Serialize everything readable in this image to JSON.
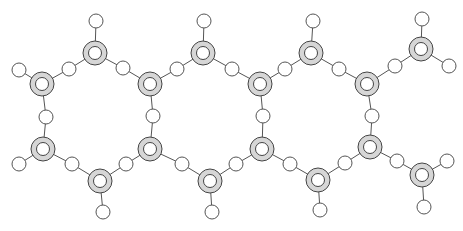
{
  "diagram": {
    "title": "",
    "colors": {
      "background": "#ffffff",
      "large_atom_fill": "#d6d6d6",
      "large_atom_stroke": "#444444",
      "small_atom_fill": "#ffffff",
      "bond": "#555555"
    },
    "large_atoms": [
      {
        "id": "T1",
        "x": 95,
        "y": 53
      },
      {
        "id": "T2",
        "x": 203,
        "y": 53
      },
      {
        "id": "T3",
        "x": 311,
        "y": 53
      },
      {
        "id": "T4",
        "x": 421,
        "y": 49
      },
      {
        "id": "U1",
        "x": 42,
        "y": 84
      },
      {
        "id": "U2",
        "x": 150,
        "y": 84
      },
      {
        "id": "U3",
        "x": 260,
        "y": 84
      },
      {
        "id": "U4",
        "x": 367,
        "y": 84
      },
      {
        "id": "L1",
        "x": 43,
        "y": 149
      },
      {
        "id": "L2",
        "x": 150,
        "y": 149
      },
      {
        "id": "L3",
        "x": 262,
        "y": 149
      },
      {
        "id": "L4",
        "x": 370,
        "y": 147
      },
      {
        "id": "B1",
        "x": 100,
        "y": 181
      },
      {
        "id": "B2",
        "x": 210,
        "y": 181
      },
      {
        "id": "B3",
        "x": 318,
        "y": 180
      },
      {
        "id": "B4",
        "x": 422,
        "y": 175
      }
    ],
    "small_atoms": [
      {
        "id": "hT1",
        "x": 96,
        "y": 21
      },
      {
        "id": "hT2",
        "x": 204,
        "y": 21
      },
      {
        "id": "hT3",
        "x": 313,
        "y": 21
      },
      {
        "id": "hT4",
        "x": 422,
        "y": 19
      },
      {
        "id": "hU1",
        "x": 19,
        "y": 70
      },
      {
        "id": "hT4r",
        "x": 449,
        "y": 66
      },
      {
        "id": "hL1",
        "x": 19,
        "y": 164
      },
      {
        "id": "hB1",
        "x": 103,
        "y": 212
      },
      {
        "id": "hB2",
        "x": 212,
        "y": 212
      },
      {
        "id": "hB3",
        "x": 320,
        "y": 210
      },
      {
        "id": "hB4",
        "x": 424,
        "y": 207
      },
      {
        "id": "hB4r",
        "x": 447,
        "y": 161
      },
      {
        "id": "m1",
        "x": 69,
        "y": 69
      },
      {
        "id": "m2",
        "x": 123,
        "y": 68
      },
      {
        "id": "m3",
        "x": 177,
        "y": 69
      },
      {
        "id": "m4",
        "x": 232,
        "y": 69
      },
      {
        "id": "m5",
        "x": 285,
        "y": 69
      },
      {
        "id": "m6",
        "x": 339,
        "y": 69
      },
      {
        "id": "m7",
        "x": 395,
        "y": 66
      },
      {
        "id": "m8",
        "x": 46,
        "y": 117
      },
      {
        "id": "m9",
        "x": 153,
        "y": 116
      },
      {
        "id": "m10",
        "x": 263,
        "y": 116
      },
      {
        "id": "m11",
        "x": 372,
        "y": 116
      },
      {
        "id": "m12",
        "x": 72,
        "y": 164
      },
      {
        "id": "m13",
        "x": 126,
        "y": 164
      },
      {
        "id": "m14",
        "x": 182,
        "y": 164
      },
      {
        "id": "m15",
        "x": 236,
        "y": 164
      },
      {
        "id": "m16",
        "x": 290,
        "y": 164
      },
      {
        "id": "m17",
        "x": 345,
        "y": 163
      },
      {
        "id": "m18",
        "x": 397,
        "y": 161
      }
    ],
    "bonds": [
      [
        "T1",
        "hT1"
      ],
      [
        "T2",
        "hT2"
      ],
      [
        "T3",
        "hT3"
      ],
      [
        "T4",
        "hT4"
      ],
      [
        "T4",
        "hT4r"
      ],
      [
        "U1",
        "hU1"
      ],
      [
        "L1",
        "hL1"
      ],
      [
        "B1",
        "hB1"
      ],
      [
        "B2",
        "hB2"
      ],
      [
        "B3",
        "hB3"
      ],
      [
        "B4",
        "hB4"
      ],
      [
        "B4",
        "hB4r"
      ],
      [
        "U1",
        "m1"
      ],
      [
        "m1",
        "T1"
      ],
      [
        "T1",
        "m2"
      ],
      [
        "m2",
        "U2"
      ],
      [
        "U2",
        "m3"
      ],
      [
        "m3",
        "T2"
      ],
      [
        "T2",
        "m4"
      ],
      [
        "m4",
        "U3"
      ],
      [
        "U3",
        "m5"
      ],
      [
        "m5",
        "T3"
      ],
      [
        "T3",
        "m6"
      ],
      [
        "m6",
        "U4"
      ],
      [
        "U4",
        "m7"
      ],
      [
        "m7",
        "T4"
      ],
      [
        "U1",
        "m8"
      ],
      [
        "m8",
        "L1"
      ],
      [
        "U2",
        "m9"
      ],
      [
        "m9",
        "L2"
      ],
      [
        "U3",
        "m10"
      ],
      [
        "m10",
        "L3"
      ],
      [
        "U4",
        "m11"
      ],
      [
        "m11",
        "L4"
      ],
      [
        "L1",
        "m12"
      ],
      [
        "m12",
        "B1"
      ],
      [
        "B1",
        "m13"
      ],
      [
        "m13",
        "L2"
      ],
      [
        "L2",
        "m14"
      ],
      [
        "m14",
        "B2"
      ],
      [
        "B2",
        "m15"
      ],
      [
        "m15",
        "L3"
      ],
      [
        "L3",
        "m16"
      ],
      [
        "m16",
        "B3"
      ],
      [
        "B3",
        "m17"
      ],
      [
        "m17",
        "L4"
      ],
      [
        "L4",
        "m18"
      ],
      [
        "m18",
        "B4"
      ]
    ],
    "sizes": {
      "large_outer_r": 12,
      "large_inner_r": 6.5,
      "small_r": 7
    }
  }
}
